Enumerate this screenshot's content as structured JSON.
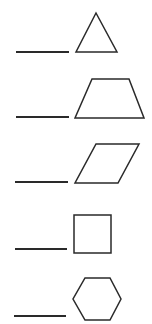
{
  "worksheet": {
    "instructions": "",
    "stroke_color": "#2a2a2a",
    "items": [
      {
        "index": 1,
        "shape": "triangle",
        "answer": "",
        "line": {
          "x1": 16,
          "x2": 69,
          "y": 52
        },
        "points": "96,13 76,52 117,52"
      },
      {
        "index": 2,
        "shape": "trapezoid",
        "answer": "",
        "line": {
          "x1": 16,
          "x2": 69,
          "y": 117
        },
        "points": "92,79 129,79 144,118 75,118"
      },
      {
        "index": 3,
        "shape": "parallelogram",
        "answer": "",
        "line": {
          "x1": 15,
          "x2": 68,
          "y": 182
        },
        "points": "96,144 139,144 118,183 75,183"
      },
      {
        "index": 4,
        "shape": "square",
        "answer": "",
        "line": {
          "x1": 15,
          "x2": 67,
          "y": 249
        },
        "points": "74,215 111,215 111,253 74,253"
      },
      {
        "index": 5,
        "shape": "hexagon",
        "answer": "",
        "line": {
          "x1": 14,
          "x2": 66,
          "y": 316
        },
        "points": "85,278 110,278 121,299 110,320 85,320 73,299"
      }
    ]
  }
}
